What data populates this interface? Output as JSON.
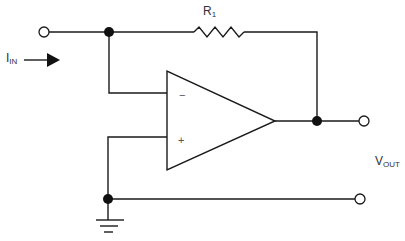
{
  "diagram": {
    "type": "circuit-schematic",
    "labels": {
      "input_current": {
        "main": "I",
        "sub": "IN"
      },
      "resistor": {
        "main": "R",
        "sub": "1"
      },
      "output_voltage": {
        "main": "V",
        "sub": "OUT"
      },
      "inverting_input": "−",
      "noninverting_input": "+"
    },
    "components": [
      {
        "id": "R1",
        "kind": "resistor",
        "label": "R1"
      },
      {
        "id": "U1",
        "kind": "op-amp"
      },
      {
        "id": "GND",
        "kind": "ground"
      }
    ],
    "terminals": [
      "input",
      "output",
      "output-reference"
    ],
    "colors": {
      "line": "#1a1a1a",
      "node": "#111111",
      "background": "#ffffff",
      "text": "#333333"
    }
  }
}
